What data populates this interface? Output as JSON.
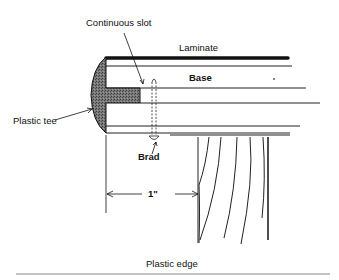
{
  "diagram": {
    "title": "Plastic edge",
    "labels": {
      "continuous_slot": "Continuous slot",
      "laminate": "Laminate",
      "base": "Base",
      "plastic_tee": "Plastic tee",
      "brad": "Brad",
      "dimension": "1\""
    },
    "colors": {
      "line": "#1a1a1a",
      "tee_fill": "#6e6e6e",
      "background": "#ffffff",
      "rule": "#888888"
    }
  }
}
